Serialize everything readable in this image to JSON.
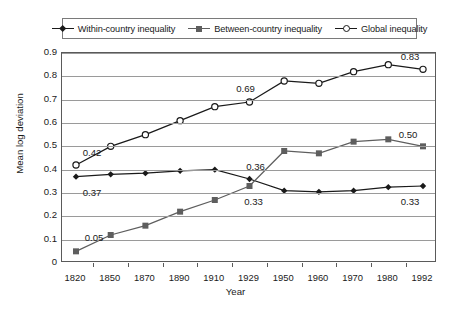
{
  "chart_data": {
    "type": "line",
    "title": "",
    "xlabel": "Year",
    "ylabel": "Mean log deviation",
    "categories": [
      "1820",
      "1850",
      "1870",
      "1890",
      "1910",
      "1929",
      "1950",
      "1960",
      "1970",
      "1980",
      "1992"
    ],
    "ylim": [
      0,
      0.9
    ],
    "ytick_labels": [
      "0.9",
      "0.8",
      "0.7",
      "0.6",
      "0.5",
      "0.4",
      "0.3",
      "0.2",
      "0.1",
      "0"
    ],
    "ytick_values": [
      0.9,
      0.8,
      0.7,
      0.6,
      0.5,
      0.4,
      0.3,
      0.2,
      0.1,
      0
    ],
    "grid": true,
    "legend_position": "top",
    "series": [
      {
        "name": "Within-country inequality",
        "marker": "diamond",
        "color": "#1a1a1a",
        "values": [
          0.37,
          0.38,
          0.385,
          0.395,
          0.4,
          0.36,
          0.31,
          0.305,
          0.31,
          0.325,
          0.33
        ]
      },
      {
        "name": "Between-country inequality",
        "marker": "square",
        "color": "#5e5e5e",
        "values": [
          0.05,
          0.12,
          0.16,
          0.22,
          0.27,
          0.33,
          0.48,
          0.47,
          0.52,
          0.53,
          0.5
        ]
      },
      {
        "name": "Global inequality",
        "marker": "circle-open",
        "color": "#1a1a1a",
        "values": [
          0.42,
          0.5,
          0.55,
          0.61,
          0.67,
          0.69,
          0.78,
          0.77,
          0.82,
          0.85,
          0.83
        ]
      }
    ],
    "annotations": [
      {
        "text": "0.42",
        "series": "Global inequality",
        "category": "1820"
      },
      {
        "text": "0.37",
        "series": "Within-country inequality",
        "category": "1820"
      },
      {
        "text": "0.05",
        "series": "Between-country inequality",
        "category": "1820"
      },
      {
        "text": "0.69",
        "series": "Global inequality",
        "category": "1929"
      },
      {
        "text": "0.36",
        "series": "Within-country inequality",
        "category": "1929"
      },
      {
        "text": "0.33",
        "series": "Between-country inequality",
        "category": "1929"
      },
      {
        "text": "0.83",
        "series": "Global inequality",
        "category": "1992"
      },
      {
        "text": "0.50",
        "series": "Between-country inequality",
        "category": "1992"
      },
      {
        "text": "0.33",
        "series": "Within-country inequality",
        "category": "1992"
      }
    ]
  },
  "legend": {
    "items": [
      {
        "label": "Within-country inequality"
      },
      {
        "label": "Between-country inequality"
      },
      {
        "label": "Global inequality"
      }
    ]
  }
}
